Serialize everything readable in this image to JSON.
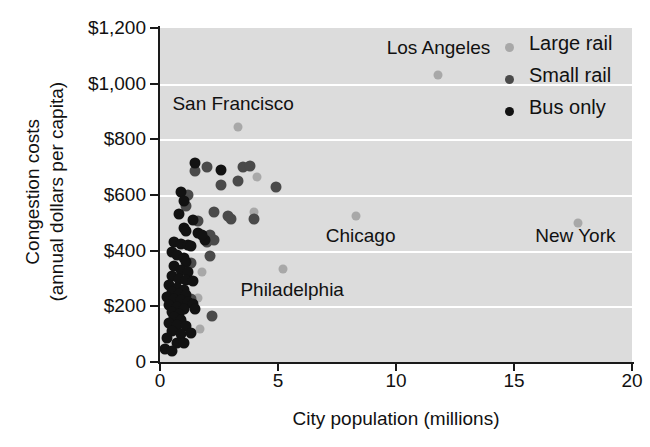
{
  "chart_data": {
    "type": "scatter",
    "title": "",
    "xlabel": "City population (millions)",
    "ylabel": "Congestion costs\n(annual dollars per capita)",
    "ylabel_line1": "Congestion costs",
    "ylabel_line2": "(annual dollars per capita)",
    "xlim": [
      0,
      20
    ],
    "ylim": [
      0,
      1200
    ],
    "xticks": [
      0,
      5,
      10,
      15,
      20
    ],
    "xtick_labels": [
      "0",
      "5",
      "10",
      "15",
      "20"
    ],
    "yticks": [
      0,
      200,
      400,
      600,
      800,
      1000,
      1200
    ],
    "ytick_labels": [
      "0",
      "$200",
      "$400",
      "$600",
      "$800",
      "$1,000",
      "$1,200"
    ],
    "grid": "horizontal-white-bands",
    "legend_position": "top-right",
    "colors": {
      "large_rail": "#a8a8a8",
      "small_rail": "#4a4a4a",
      "bus_only": "#121212",
      "panel": "#dcdcdc",
      "gridline": "#ffffff",
      "axis": "#1a1a1a"
    },
    "legend": [
      {
        "label": "Large rail",
        "color": "#a8a8a8",
        "key": "large"
      },
      {
        "label": "Small rail",
        "color": "#4a4a4a",
        "key": "small"
      },
      {
        "label": "Bus only",
        "color": "#121212",
        "key": "bus"
      }
    ],
    "annotations": [
      {
        "text": "Los Angeles",
        "x": 11.8,
        "y": 1125
      },
      {
        "text": "San Francisco",
        "x": 3.1,
        "y": 925
      },
      {
        "text": "Chicago",
        "x": 8.5,
        "y": 450
      },
      {
        "text": "New York",
        "x": 17.6,
        "y": 450
      },
      {
        "text": "Philadelphia",
        "x": 5.6,
        "y": 255
      }
    ],
    "series": [
      {
        "name": "Large rail",
        "key": "large",
        "color": "#a8a8a8",
        "points": [
          {
            "x": 17.7,
            "y": 500,
            "city": "New York"
          },
          {
            "x": 11.8,
            "y": 1030,
            "city": "Los Angeles"
          },
          {
            "x": 8.3,
            "y": 525,
            "city": "Chicago"
          },
          {
            "x": 5.2,
            "y": 335,
            "city": "Philadelphia"
          },
          {
            "x": 3.3,
            "y": 845,
            "city": "San Francisco"
          },
          {
            "x": 4.1,
            "y": 665,
            "city": ""
          },
          {
            "x": 4.0,
            "y": 540,
            "city": ""
          },
          {
            "x": 1.8,
            "y": 325,
            "city": ""
          },
          {
            "x": 1.6,
            "y": 230,
            "city": ""
          },
          {
            "x": 1.7,
            "y": 120,
            "city": ""
          }
        ]
      },
      {
        "name": "Small rail",
        "key": "small",
        "color": "#4a4a4a",
        "points": [
          {
            "x": 2.0,
            "y": 700,
            "city": ""
          },
          {
            "x": 1.5,
            "y": 685,
            "city": ""
          },
          {
            "x": 3.5,
            "y": 700,
            "city": ""
          },
          {
            "x": 3.8,
            "y": 705,
            "city": ""
          },
          {
            "x": 3.3,
            "y": 650,
            "city": ""
          },
          {
            "x": 2.6,
            "y": 635,
            "city": ""
          },
          {
            "x": 4.9,
            "y": 630,
            "city": ""
          },
          {
            "x": 1.2,
            "y": 600,
            "city": ""
          },
          {
            "x": 1.1,
            "y": 560,
            "city": ""
          },
          {
            "x": 2.3,
            "y": 540,
            "city": ""
          },
          {
            "x": 2.9,
            "y": 525,
            "city": ""
          },
          {
            "x": 3.0,
            "y": 515,
            "city": ""
          },
          {
            "x": 4.0,
            "y": 515,
            "city": ""
          },
          {
            "x": 1.6,
            "y": 505,
            "city": ""
          },
          {
            "x": 2.1,
            "y": 455,
            "city": ""
          },
          {
            "x": 2.0,
            "y": 430,
            "city": ""
          },
          {
            "x": 2.3,
            "y": 440,
            "city": ""
          },
          {
            "x": 2.1,
            "y": 380,
            "city": ""
          },
          {
            "x": 1.3,
            "y": 355,
            "city": ""
          },
          {
            "x": 1.2,
            "y": 300,
            "city": ""
          },
          {
            "x": 1.3,
            "y": 225,
            "city": ""
          },
          {
            "x": 2.2,
            "y": 165,
            "city": ""
          }
        ]
      },
      {
        "name": "Bus only",
        "key": "bus",
        "color": "#121212",
        "points": [
          {
            "x": 0.9,
            "y": 610,
            "city": ""
          },
          {
            "x": 1.0,
            "y": 580,
            "city": ""
          },
          {
            "x": 0.8,
            "y": 530,
            "city": ""
          },
          {
            "x": 1.4,
            "y": 510,
            "city": ""
          },
          {
            "x": 1.0,
            "y": 480,
            "city": ""
          },
          {
            "x": 1.1,
            "y": 470,
            "city": ""
          },
          {
            "x": 1.6,
            "y": 465,
            "city": ""
          },
          {
            "x": 0.6,
            "y": 430,
            "city": ""
          },
          {
            "x": 0.9,
            "y": 425,
            "city": ""
          },
          {
            "x": 1.2,
            "y": 420,
            "city": ""
          },
          {
            "x": 1.3,
            "y": 415,
            "city": ""
          },
          {
            "x": 1.9,
            "y": 440,
            "city": ""
          },
          {
            "x": 0.5,
            "y": 395,
            "city": ""
          },
          {
            "x": 0.7,
            "y": 385,
            "city": ""
          },
          {
            "x": 1.0,
            "y": 375,
            "city": ""
          },
          {
            "x": 1.1,
            "y": 360,
            "city": ""
          },
          {
            "x": 0.6,
            "y": 345,
            "city": ""
          },
          {
            "x": 0.9,
            "y": 330,
            "city": ""
          },
          {
            "x": 1.2,
            "y": 325,
            "city": ""
          },
          {
            "x": 0.5,
            "y": 310,
            "city": ""
          },
          {
            "x": 0.8,
            "y": 300,
            "city": ""
          },
          {
            "x": 1.1,
            "y": 295,
            "city": ""
          },
          {
            "x": 1.4,
            "y": 290,
            "city": ""
          },
          {
            "x": 0.4,
            "y": 275,
            "city": ""
          },
          {
            "x": 0.7,
            "y": 265,
            "city": ""
          },
          {
            "x": 1.0,
            "y": 260,
            "city": ""
          },
          {
            "x": 0.5,
            "y": 250,
            "city": ""
          },
          {
            "x": 0.8,
            "y": 245,
            "city": ""
          },
          {
            "x": 1.1,
            "y": 240,
            "city": ""
          },
          {
            "x": 0.3,
            "y": 235,
            "city": ""
          },
          {
            "x": 0.6,
            "y": 228,
            "city": ""
          },
          {
            "x": 0.9,
            "y": 222,
            "city": ""
          },
          {
            "x": 1.2,
            "y": 215,
            "city": ""
          },
          {
            "x": 1.4,
            "y": 210,
            "city": ""
          },
          {
            "x": 0.4,
            "y": 205,
            "city": ""
          },
          {
            "x": 0.7,
            "y": 198,
            "city": ""
          },
          {
            "x": 1.0,
            "y": 192,
            "city": ""
          },
          {
            "x": 0.5,
            "y": 180,
            "city": ""
          },
          {
            "x": 0.8,
            "y": 172,
            "city": ""
          },
          {
            "x": 1.5,
            "y": 190,
            "city": ""
          },
          {
            "x": 0.6,
            "y": 160,
            "city": ""
          },
          {
            "x": 0.9,
            "y": 152,
            "city": ""
          },
          {
            "x": 0.4,
            "y": 140,
            "city": ""
          },
          {
            "x": 0.7,
            "y": 132,
            "city": ""
          },
          {
            "x": 1.1,
            "y": 130,
            "city": ""
          },
          {
            "x": 0.5,
            "y": 110,
            "city": ""
          },
          {
            "x": 0.9,
            "y": 100,
            "city": ""
          },
          {
            "x": 1.3,
            "y": 105,
            "city": ""
          },
          {
            "x": 0.3,
            "y": 85,
            "city": ""
          },
          {
            "x": 0.7,
            "y": 70,
            "city": ""
          },
          {
            "x": 1.0,
            "y": 68,
            "city": ""
          },
          {
            "x": 0.2,
            "y": 45,
            "city": ""
          },
          {
            "x": 0.5,
            "y": 38,
            "city": ""
          },
          {
            "x": 1.5,
            "y": 715,
            "city": ""
          },
          {
            "x": 2.6,
            "y": 690,
            "city": ""
          },
          {
            "x": 1.8,
            "y": 455,
            "city": ""
          }
        ]
      }
    ]
  }
}
